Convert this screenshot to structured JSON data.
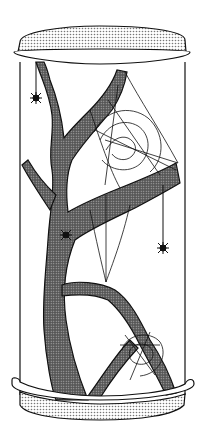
{
  "illustration": {
    "subject": "spider terrarium",
    "colors": {
      "background": "#ffffff",
      "ink": "#111111",
      "lid_fill": "#c8c8c8",
      "branch_fill": "#7a7a7a",
      "base_fill": "#d4d4d4"
    },
    "elements": [
      "lid",
      "glass-cylinder",
      "branch",
      "large-web",
      "small-web",
      "spider-hanging-left",
      "spider-on-branch",
      "spider-hanging-right",
      "base"
    ]
  }
}
